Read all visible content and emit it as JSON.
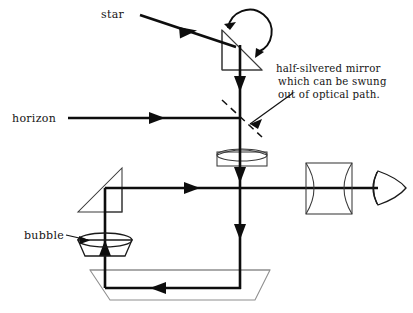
{
  "figure": {
    "kind": "optical-ray-diagram",
    "title_visible": false,
    "background_color": "#ffffff",
    "ink_color": "#0d0d0d",
    "optic_outline_color": "#3a3a3a",
    "faint_outline_color": "#8e8e8e"
  },
  "labels": {
    "star": "star",
    "horizon": "horizon",
    "bubble": "bubble",
    "annotation_line1": "half-silvered mirror",
    "annotation_line2": "which can be swung",
    "annotation_line3": "out of optical path.",
    "caption_clipped": ""
  },
  "components": [
    {
      "id": "star-source-beam",
      "name": "star input ray",
      "type": "ray",
      "label": "star",
      "direction": "down-right"
    },
    {
      "id": "top-prism",
      "name": "rotatable top prism mirror",
      "type": "right-triangle-prism",
      "rotatable": true
    },
    {
      "id": "rotation-arrow",
      "name": "rotation indicator arc",
      "type": "curved-arrow"
    },
    {
      "id": "half-silvered-mirror",
      "name": "half-silvered mirror",
      "type": "dashed-beamsplitter",
      "note": "half-silvered mirror which can be swung out of optical path."
    },
    {
      "id": "horizon-beam",
      "name": "horizon input ray",
      "type": "ray",
      "label": "horizon",
      "direction": "right"
    },
    {
      "id": "field-lens",
      "name": "plano-convex field lens",
      "type": "lens"
    },
    {
      "id": "left-prism",
      "name": "left folding prism",
      "type": "right-triangle-prism"
    },
    {
      "id": "bubble-unit",
      "name": "bubble level assembly",
      "type": "bubble-chamber",
      "label": "bubble"
    },
    {
      "id": "bottom-prism",
      "name": "bottom trapezoid prism",
      "type": "trapezoid-prism"
    },
    {
      "id": "eyepiece-lens",
      "name": "biconvex eyepiece lens",
      "type": "lens"
    },
    {
      "id": "eye",
      "name": "observer eye",
      "type": "eye-symbol"
    }
  ],
  "ray_paths": [
    {
      "id": "star-to-prism",
      "from": "star",
      "to": "top-prism"
    },
    {
      "id": "prism-down",
      "from": "top-prism",
      "to": "half-silvered-mirror"
    },
    {
      "id": "horizon-in",
      "from": "horizon",
      "to": "half-silvered-mirror"
    },
    {
      "id": "through-field-lens",
      "from": "half-silvered-mirror",
      "to": "field-lens"
    },
    {
      "id": "down-to-axis",
      "from": "field-lens",
      "to": "eyepiece-axis"
    },
    {
      "id": "down-to-bottom",
      "from": "eyepiece-axis",
      "to": "bottom-prism"
    },
    {
      "id": "bottom-left",
      "from": "bottom-prism-right",
      "to": "bottom-prism-left"
    },
    {
      "id": "up-through-bubble",
      "from": "bottom-prism-left",
      "to": "left-prism"
    },
    {
      "id": "left-prism-to-eye",
      "from": "left-prism",
      "to": "eye"
    }
  ]
}
